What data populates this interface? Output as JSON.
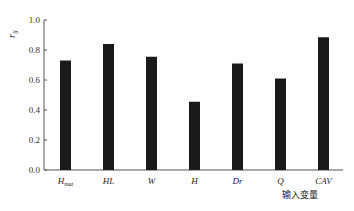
{
  "chart_data": {
    "type": "bar",
    "title": "",
    "xlabel": "输入变量",
    "ylabel": "r_ij",
    "ylim": [
      0,
      1.0
    ],
    "yticks": [
      "0.0",
      "0.2",
      "0.4",
      "0.6",
      "0.8",
      "1.0"
    ],
    "grid": false,
    "categories": [
      "H_mat",
      "HL",
      "W",
      "H",
      "Dr",
      "Q",
      "CAV"
    ],
    "category_display": [
      {
        "main": "H",
        "sub": "mat"
      },
      {
        "main": "HL",
        "sub": ""
      },
      {
        "main": "W",
        "sub": ""
      },
      {
        "main": "H",
        "sub": ""
      },
      {
        "main": "Dr",
        "sub": ""
      },
      {
        "main": "Q",
        "sub": ""
      },
      {
        "main": "CAV",
        "sub": ""
      }
    ],
    "values": [
      0.73,
      0.84,
      0.755,
      0.455,
      0.71,
      0.61,
      0.885
    ],
    "bar_color": "#1a1a1a"
  },
  "axis": {
    "xlabel": "输入变量",
    "ylabel_main": "r",
    "ylabel_sub": "ij"
  }
}
